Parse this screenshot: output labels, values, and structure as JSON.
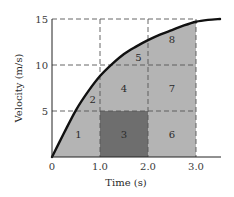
{
  "chart_data": {
    "type": "area",
    "title": "",
    "xlabel": "Time (s)",
    "ylabel": "Velocity (m/s)",
    "xlim": [
      0,
      3.5
    ],
    "ylim": [
      0,
      15
    ],
    "x_ticks": [
      {
        "value": 0,
        "label": "0"
      },
      {
        "value": 1.0,
        "label": "1.0"
      },
      {
        "value": 2.0,
        "label": "2.0"
      },
      {
        "value": 3.0,
        "label": "3.0"
      }
    ],
    "y_ticks": [
      {
        "value": 5,
        "label": "5"
      },
      {
        "value": 10,
        "label": "10"
      },
      {
        "value": 15,
        "label": "15"
      }
    ],
    "grid": {
      "style": "dashed",
      "x": [
        1.0,
        2.0,
        3.0
      ],
      "y": [
        5,
        10,
        15
      ]
    },
    "series": [
      {
        "name": "velocity curve",
        "x": [
          0,
          0.25,
          0.5,
          0.75,
          1.0,
          1.25,
          1.5,
          1.75,
          2.0,
          2.25,
          2.5,
          2.75,
          3.0,
          3.25,
          3.5
        ],
        "values": [
          0,
          2.6,
          5.1,
          7.1,
          8.8,
          10.1,
          11.2,
          12.0,
          12.7,
          13.3,
          13.8,
          14.3,
          14.7,
          14.9,
          15.0
        ]
      }
    ],
    "shaded_area": {
      "from_t": 0,
      "to_t": 3.0,
      "color": "#b4b4b4"
    },
    "highlight_region": {
      "label": "3",
      "t": [
        1.0,
        2.0
      ],
      "v": [
        0,
        5
      ],
      "color": "#6e6e6e"
    },
    "regions": [
      {
        "label": "1",
        "t": 0.55,
        "v": 2.5
      },
      {
        "label": "2",
        "t": 0.85,
        "v": 6.3
      },
      {
        "label": "3",
        "t": 1.5,
        "v": 2.5
      },
      {
        "label": "4",
        "t": 1.5,
        "v": 7.5
      },
      {
        "label": "5",
        "t": 1.8,
        "v": 10.8
      },
      {
        "label": "6",
        "t": 2.5,
        "v": 2.5
      },
      {
        "label": "7",
        "t": 2.5,
        "v": 7.5
      },
      {
        "label": "8",
        "t": 2.5,
        "v": 12.8
      }
    ],
    "colors": {
      "curve": "#111111",
      "fill": "#b4b4b4",
      "highlight": "#6e6e6e",
      "grid": "#555555",
      "axis": "#222222"
    }
  }
}
